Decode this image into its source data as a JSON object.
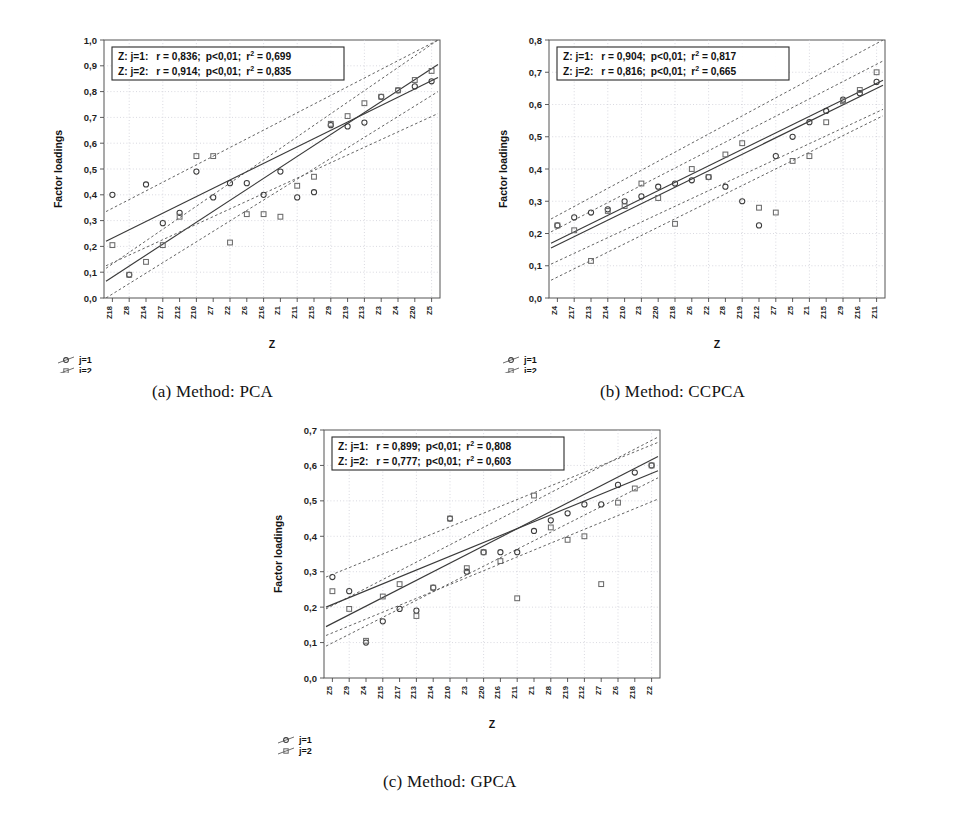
{
  "figure": {
    "panels": [
      {
        "id": "a",
        "caption": "(a) Method: PCA",
        "stats": [
          {
            "label": "Z: j=1:",
            "r": "r = 0,836;",
            "p": "p<0,01;",
            "r2_prefix": "r",
            "r2_sup": "2",
            "r2_value": " = 0,699"
          },
          {
            "label": "Z: j=2:",
            "r": "r = 0,914;",
            "p": "p<0,01;",
            "r2_prefix": "r",
            "r2_sup": "2",
            "r2_value": " = 0,835"
          }
        ],
        "legend": [
          {
            "symbol": "circle",
            "label": "j=1"
          },
          {
            "symbol": "square",
            "label": "j=2"
          }
        ],
        "chart_data": {
          "type": "scatter",
          "title": "",
          "xlabel": "Z",
          "ylabel": "Factor loadings",
          "ylim": [
            0.0,
            1.0
          ],
          "ytick_labels": [
            "0,0",
            "0,1",
            "0,2",
            "0,3",
            "0,4",
            "0,5",
            "0,6",
            "0,7",
            "0,8",
            "0,9",
            "1,0"
          ],
          "ytick_values": [
            0.0,
            0.1,
            0.2,
            0.3,
            0.4,
            0.5,
            0.6,
            0.7,
            0.8,
            0.9,
            1.0
          ],
          "categories": [
            "Z18",
            "Z8",
            "Z14",
            "Z17",
            "Z12",
            "Z10",
            "Z7",
            "Z2",
            "Z6",
            "Z16",
            "Z1",
            "Z11",
            "Z15",
            "Z9",
            "Z19",
            "Z13",
            "Z3",
            "Z4",
            "Z20",
            "Z5"
          ],
          "grid": true,
          "legend_position": "below-left",
          "series": [
            {
              "name": "j=1",
              "marker": "circle",
              "values": [
                0.4,
                0.09,
                0.44,
                0.29,
                0.33,
                0.49,
                0.39,
                0.445,
                0.445,
                0.4,
                0.49,
                0.39,
                0.41,
                0.67,
                0.665,
                0.68,
                0.78,
                0.805,
                0.82,
                0.84
              ],
              "fit": {
                "y_start": 0.065,
                "y_end": 0.905
              },
              "band_upper": {
                "y_start": 0.115,
                "y_end": 1.0
              },
              "band_lower": {
                "y_start": 0.0,
                "y_end": 0.8
              }
            },
            {
              "name": "j=2",
              "marker": "square",
              "values": [
                0.205,
                0.09,
                0.14,
                0.205,
                0.315,
                0.55,
                0.55,
                0.215,
                0.325,
                0.325,
                0.315,
                0.435,
                0.47,
                0.675,
                0.705,
                0.755,
                0.78,
                0.805,
                0.845,
                0.88
              ],
              "fit": {
                "y_start": 0.22,
                "y_end": 0.855
              },
              "band_upper": {
                "y_start": 0.335,
                "y_end": 1.0
              },
              "band_lower": {
                "y_start": 0.125,
                "y_end": 0.715
              }
            }
          ]
        }
      },
      {
        "id": "b",
        "caption": "(b) Method: CCPCA",
        "stats": [
          {
            "label": "Z: j=1:",
            "r": "r = 0,904;",
            "p": "p<0,01;",
            "r2_prefix": "r",
            "r2_sup": "2",
            "r2_value": " = 0,817"
          },
          {
            "label": "Z: j=2:",
            "r": "r = 0,816;",
            "p": "p<0,01;",
            "r2_prefix": "r",
            "r2_sup": "2",
            "r2_value": " = 0,665"
          }
        ],
        "legend": [
          {
            "symbol": "circle",
            "label": "j=1"
          },
          {
            "symbol": "square",
            "label": "j=2"
          }
        ],
        "chart_data": {
          "type": "scatter",
          "title": "",
          "xlabel": "Z",
          "ylabel": "Factor loadings",
          "ylim": [
            0.0,
            0.8
          ],
          "ytick_labels": [
            "0,0",
            "0,1",
            "0,2",
            "0,3",
            "0,4",
            "0,5",
            "0,6",
            "0,7",
            "0,8"
          ],
          "ytick_values": [
            0.0,
            0.1,
            0.2,
            0.3,
            0.4,
            0.5,
            0.6,
            0.7,
            0.8
          ],
          "categories": [
            "Z4",
            "Z17",
            "Z13",
            "Z14",
            "Z10",
            "Z3",
            "Z20",
            "Z18",
            "Z6",
            "Z2",
            "Z8",
            "Z19",
            "Z12",
            "Z7",
            "Z5",
            "Z1",
            "Z15",
            "Z9",
            "Z16",
            "Z11"
          ],
          "grid": true,
          "legend_position": "below-left",
          "series": [
            {
              "name": "j=1",
              "marker": "circle",
              "values": [
                0.225,
                0.25,
                0.265,
                0.275,
                0.3,
                0.315,
                0.345,
                0.355,
                0.365,
                0.375,
                0.345,
                0.3,
                0.225,
                0.44,
                0.5,
                0.545,
                0.58,
                0.615,
                0.635,
                0.67
              ],
              "fit": {
                "y_start": 0.155,
                "y_end": 0.66
              },
              "band_upper": {
                "y_start": 0.205,
                "y_end": 0.735
              },
              "band_lower": {
                "y_start": 0.105,
                "y_end": 0.585
              }
            },
            {
              "name": "j=2",
              "marker": "square",
              "values": [
                0.225,
                0.21,
                0.115,
                0.27,
                0.285,
                0.355,
                0.31,
                0.23,
                0.4,
                0.375,
                0.445,
                0.48,
                0.28,
                0.265,
                0.425,
                0.44,
                0.545,
                0.61,
                0.645,
                0.7
              ],
              "fit": {
                "y_start": 0.17,
                "y_end": 0.675
              },
              "band_upper": {
                "y_start": 0.245,
                "y_end": 0.8
              },
              "band_lower": {
                "y_start": 0.055,
                "y_end": 0.565
              }
            }
          ]
        }
      },
      {
        "id": "c",
        "caption": "(c) Method: GPCA",
        "stats": [
          {
            "label": "Z: j=1:",
            "r": "r = 0,899;",
            "p": "p<0,01;",
            "r2_prefix": "r",
            "r2_sup": "2",
            "r2_value": " = 0,808"
          },
          {
            "label": "Z: j=2:",
            "r": "r = 0,777;",
            "p": "p<0,01;",
            "r2_prefix": "r",
            "r2_sup": "2",
            "r2_value": " = 0,603"
          }
        ],
        "legend": [
          {
            "symbol": "circle",
            "label": "j=1"
          },
          {
            "symbol": "square",
            "label": "j=2"
          }
        ],
        "chart_data": {
          "type": "scatter",
          "title": "",
          "xlabel": "Z",
          "ylabel": "Factor loadings",
          "ylim": [
            0.0,
            0.7
          ],
          "ytick_labels": [
            "0,0",
            "0,1",
            "0,2",
            "0,3",
            "0,4",
            "0,5",
            "0,6",
            "0,7"
          ],
          "ytick_values": [
            0.0,
            0.1,
            0.2,
            0.3,
            0.4,
            0.5,
            0.6,
            0.7
          ],
          "categories": [
            "Z5",
            "Z9",
            "Z4",
            "Z15",
            "Z17",
            "Z13",
            "Z14",
            "Z10",
            "Z3",
            "Z20",
            "Z16",
            "Z11",
            "Z1",
            "Z8",
            "Z19",
            "Z12",
            "Z7",
            "Z6",
            "Z18",
            "Z2"
          ],
          "grid": true,
          "legend_position": "below-left",
          "series": [
            {
              "name": "j=1",
              "marker": "circle",
              "values": [
                0.285,
                0.245,
                0.1,
                0.16,
                0.195,
                0.19,
                0.255,
                0.45,
                0.3,
                0.355,
                0.355,
                0.355,
                0.415,
                0.445,
                0.465,
                0.49,
                0.49,
                0.545,
                0.58,
                0.6
              ],
              "fit": {
                "y_start": 0.145,
                "y_end": 0.625
              },
              "band_upper": {
                "y_start": 0.195,
                "y_end": 0.68
              },
              "band_lower": {
                "y_start": 0.09,
                "y_end": 0.565
              }
            },
            {
              "name": "j=2",
              "marker": "square",
              "values": [
                0.245,
                0.195,
                0.105,
                0.23,
                0.265,
                0.175,
                0.255,
                0.45,
                0.31,
                0.355,
                0.33,
                0.225,
                0.515,
                0.425,
                0.39,
                0.4,
                0.265,
                0.495,
                0.535,
                0.6
              ],
              "fit": {
                "y_start": 0.2,
                "y_end": 0.585
              },
              "band_upper": {
                "y_start": 0.285,
                "y_end": 0.665
              },
              "band_lower": {
                "y_start": 0.12,
                "y_end": 0.505
              }
            }
          ]
        }
      }
    ]
  }
}
